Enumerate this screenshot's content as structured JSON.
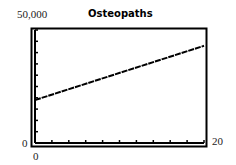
{
  "chart_data": {
    "type": "line",
    "title": "Osteopaths",
    "xlabel": "",
    "ylabel": "",
    "xlim": [
      0,
      20
    ],
    "ylim": [
      0,
      50000
    ],
    "x_tick_step": 2,
    "y_tick_step": 5000,
    "grid": false,
    "axis_labels": {
      "y_max": "50,000",
      "y_min": "0",
      "x_min": "0",
      "x_max": "20"
    },
    "series": [
      {
        "name": "Osteopaths",
        "x": [
          0,
          20
        ],
        "y": [
          19000,
          43000
        ]
      }
    ]
  }
}
